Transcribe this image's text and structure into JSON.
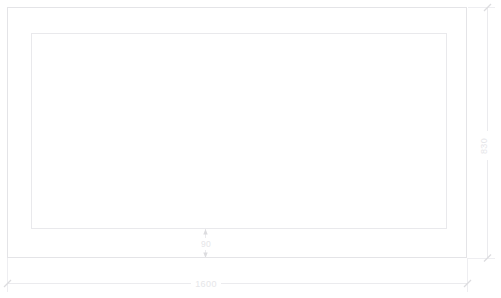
{
  "drawing": {
    "title": "Panel Elevation Drawing",
    "units": "mm",
    "background_color": "#ffffff",
    "line_color": "#e4e4e7",
    "dimension_color": "#e6e6e9",
    "canvas": {
      "width": 501,
      "height": 298
    }
  },
  "shapes": {
    "outer_rectangle": {
      "name": "outer-panel-outline",
      "x": 7,
      "y": 7,
      "width": 460,
      "height": 251
    },
    "inner_rectangle": {
      "name": "inner-opening-outline",
      "x": 31,
      "y": 33,
      "width": 416,
      "height": 196
    }
  },
  "dimensions": [
    {
      "id": "overall-width",
      "label": "1600",
      "orientation": "horizontal",
      "value": 1600,
      "text_x": 205,
      "text_y": 286,
      "line_y": 283,
      "start_x": 7,
      "end_x": 467
    },
    {
      "id": "overall-height",
      "label": "830",
      "orientation": "vertical",
      "value": 830,
      "text_x": 487,
      "text_y": 145,
      "line_x": 487,
      "start_y": 7,
      "end_y": 258
    },
    {
      "id": "bottom-rail-width",
      "label": "90",
      "orientation": "vertical",
      "value": 90,
      "text_x": 205,
      "text_y": 246,
      "line_x": 205,
      "start_y": 229,
      "end_y": 258
    }
  ]
}
